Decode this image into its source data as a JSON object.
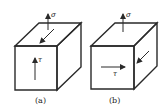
{
  "figure": {
    "panels": [
      {
        "id": "a",
        "caption": "(a)",
        "stress_normal": "σ",
        "stress_shear": "τ",
        "shear_direction": "up on front face; diagonal on top face"
      },
      {
        "id": "b",
        "caption": "(b)",
        "stress_normal": "σ",
        "stress_shear": "τ",
        "shear_direction": "right on front face; diagonal on right face"
      }
    ],
    "colors": {
      "line": "#2a2a2a",
      "background": "#ffffff"
    }
  }
}
